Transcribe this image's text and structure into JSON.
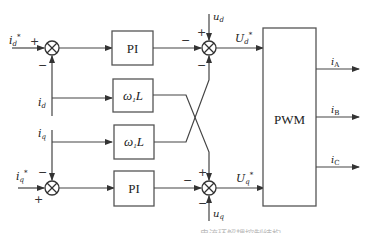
{
  "diagram": {
    "type": "dq current-loop decoupling control block diagram",
    "blocks": {
      "pi_d": {
        "label": "PI"
      },
      "wL_d": {
        "label_main": "ω",
        "label_sub": "1",
        "label_tail": "L"
      },
      "wL_q": {
        "label_main": "ω",
        "label_sub": "1",
        "label_tail": "L"
      },
      "pi_q": {
        "label": "PI"
      },
      "pwm": {
        "label": "PWM"
      }
    },
    "inputs": {
      "id_ref": {
        "main": "i",
        "sub": "d",
        "sup": "*"
      },
      "id": {
        "main": "i",
        "sub": "d"
      },
      "iq": {
        "main": "i",
        "sub": "q"
      },
      "iq_ref": {
        "main": "i",
        "sub": "q",
        "sup": "*"
      },
      "ud": {
        "main": "u",
        "sub": "d"
      },
      "uq": {
        "main": "u",
        "sub": "q"
      }
    },
    "intermediate": {
      "Ud_ref": {
        "main": "U",
        "sub": "d",
        "sup": "*"
      },
      "Uq_ref": {
        "main": "U",
        "sub": "q",
        "sup": "*"
      }
    },
    "outputs": [
      {
        "main": "i",
        "sub": "A"
      },
      {
        "main": "i",
        "sub": "B"
      },
      {
        "main": "i",
        "sub": "C"
      }
    ],
    "signs": {
      "sum1_left": "+",
      "sum1_bottom": "−",
      "sum2_left": "−",
      "sum2_bottom": "+",
      "sum3_left": "−",
      "sum3_top": "+",
      "sum3_bottom": "−",
      "sum4_left": "−",
      "sum4_top": "+",
      "sum4_bottom": "−"
    },
    "caption": "电流环解耦控制结构"
  }
}
